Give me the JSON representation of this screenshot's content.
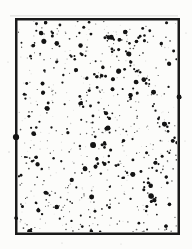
{
  "figure": {
    "kind": "star-field-photograph-scan",
    "background_color": "#fcfcfa",
    "frame": {
      "border_color": "#1a1a1a",
      "border_width": 2.5,
      "x": 16.25,
      "y": 19.25,
      "width": 162.5,
      "height": 214.5
    },
    "scan_smudge": {
      "color": "rgba(110,110,110,0.14)",
      "x": 10,
      "y": 15,
      "width": 168,
      "height": 1.6
    },
    "dots": {
      "seed": 20240613,
      "color_dark": "#141414",
      "color_mid": "#2e2e2e",
      "color_faint": "#a0a0a0",
      "faint_count": 150,
      "small_count": 270,
      "medium_count": 150,
      "large_count": 55,
      "pair_fraction": 0.25
    },
    "feature_dots": [
      {
        "x": 16,
        "y": 137,
        "r": 3.1
      },
      {
        "x": 16,
        "y": 218,
        "r": 1.8
      },
      {
        "x": 179,
        "y": 97,
        "r": 2.4
      },
      {
        "x": 93,
        "y": 145,
        "r": 2.9
      },
      {
        "x": 108,
        "y": 128,
        "r": 2.4
      },
      {
        "x": 151,
        "y": 196,
        "r": 2.7
      },
      {
        "x": 41,
        "y": 33,
        "r": 2.2
      },
      {
        "x": 136,
        "y": 82,
        "r": 2.3
      }
    ],
    "margin_specks": [
      {
        "x": 8,
        "y": 62,
        "r": 0.6
      },
      {
        "x": 186,
        "y": 33,
        "r": 0.6
      },
      {
        "x": 9,
        "y": 152,
        "r": 0.7
      },
      {
        "x": 185,
        "y": 141,
        "r": 0.5
      },
      {
        "x": 62,
        "y": 243,
        "r": 0.6
      },
      {
        "x": 121,
        "y": 244,
        "r": 0.5
      }
    ]
  }
}
